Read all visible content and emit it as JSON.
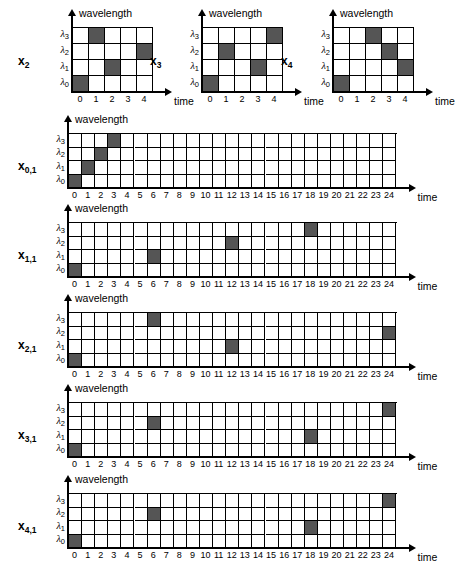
{
  "figure": {
    "axis_titles": {
      "y": "wavelength",
      "x": "time"
    },
    "wavelength_labels": [
      "λ",
      "λ",
      "λ",
      "λ"
    ],
    "wavelength_subscripts": [
      "3",
      "2",
      "1",
      "0"
    ],
    "fill_color": "#555555",
    "grid_color": "#000000",
    "background": "#ffffff"
  },
  "chart_data": {
    "type": "heatmap",
    "title": "",
    "xlabel": "time",
    "ylabel": "wavelength",
    "yticks": [
      "λ0",
      "λ1",
      "λ2",
      "λ3"
    ],
    "grid": true,
    "legend": "none",
    "panels": [
      {
        "name": "x2",
        "label_base": "x",
        "label_sub": "2",
        "columns": 5,
        "xticks": [
          "0",
          "1",
          "2",
          "3",
          "4"
        ],
        "xlim": [
          0,
          4
        ],
        "cells": [
          {
            "lambda": 3,
            "time": 1
          },
          {
            "lambda": 2,
            "time": 4
          },
          {
            "lambda": 1,
            "time": 2
          },
          {
            "lambda": 0,
            "time": 0
          }
        ]
      },
      {
        "name": "x3",
        "label_base": "x",
        "label_sub": "3",
        "columns": 5,
        "xticks": [
          "0",
          "1",
          "2",
          "3",
          "4"
        ],
        "xlim": [
          0,
          4
        ],
        "cells": [
          {
            "lambda": 3,
            "time": 4
          },
          {
            "lambda": 2,
            "time": 1
          },
          {
            "lambda": 1,
            "time": 3
          },
          {
            "lambda": 0,
            "time": 0
          }
        ]
      },
      {
        "name": "x4",
        "label_base": "x",
        "label_sub": "4",
        "columns": 5,
        "xticks": [
          "0",
          "1",
          "2",
          "3",
          "4"
        ],
        "xlim": [
          0,
          4
        ],
        "cells": [
          {
            "lambda": 3,
            "time": 2
          },
          {
            "lambda": 2,
            "time": 3
          },
          {
            "lambda": 1,
            "time": 4
          },
          {
            "lambda": 0,
            "time": 0
          }
        ]
      },
      {
        "name": "x0,1",
        "label_base": "x",
        "label_sub": "0,1",
        "columns": 25,
        "xticks": [
          "0",
          "1",
          "2",
          "3",
          "4",
          "5",
          "6",
          "7",
          "8",
          "9",
          "10",
          "11",
          "12",
          "13",
          "14",
          "15",
          "16",
          "17",
          "18",
          "19",
          "20",
          "21",
          "22",
          "23",
          "24"
        ],
        "xlim": [
          0,
          24
        ],
        "cells": [
          {
            "lambda": 0,
            "time": 0
          },
          {
            "lambda": 1,
            "time": 1
          },
          {
            "lambda": 2,
            "time": 2
          },
          {
            "lambda": 3,
            "time": 3
          }
        ]
      },
      {
        "name": "x1,1",
        "label_base": "x",
        "label_sub": "1,1",
        "columns": 25,
        "xticks": [
          "0",
          "1",
          "2",
          "3",
          "4",
          "5",
          "6",
          "7",
          "8",
          "9",
          "10",
          "11",
          "12",
          "13",
          "14",
          "15",
          "16",
          "17",
          "18",
          "19",
          "20",
          "21",
          "22",
          "23",
          "24"
        ],
        "xlim": [
          0,
          24
        ],
        "cells": [
          {
            "lambda": 0,
            "time": 0
          },
          {
            "lambda": 1,
            "time": 6
          },
          {
            "lambda": 2,
            "time": 12
          },
          {
            "lambda": 3,
            "time": 18
          }
        ]
      },
      {
        "name": "x2,1",
        "label_base": "x",
        "label_sub": "2,1",
        "columns": 25,
        "xticks": [
          "0",
          "1",
          "2",
          "3",
          "4",
          "5",
          "6",
          "7",
          "8",
          "9",
          "10",
          "11",
          "12",
          "13",
          "14",
          "15",
          "16",
          "17",
          "18",
          "19",
          "20",
          "21",
          "22",
          "23",
          "24"
        ],
        "xlim": [
          0,
          24
        ],
        "cells": [
          {
            "lambda": 0,
            "time": 0
          },
          {
            "lambda": 3,
            "time": 6
          },
          {
            "lambda": 1,
            "time": 12
          },
          {
            "lambda": 2,
            "time": 24
          }
        ]
      },
      {
        "name": "x3,1",
        "label_base": "x",
        "label_sub": "3,1",
        "columns": 25,
        "xticks": [
          "0",
          "1",
          "2",
          "3",
          "4",
          "5",
          "6",
          "7",
          "8",
          "9",
          "10",
          "11",
          "12",
          "13",
          "14",
          "15",
          "16",
          "17",
          "18",
          "19",
          "20",
          "21",
          "22",
          "23",
          "24"
        ],
        "xlim": [
          0,
          24
        ],
        "cells": [
          {
            "lambda": 0,
            "time": 0
          },
          {
            "lambda": 2,
            "time": 6
          },
          {
            "lambda": 1,
            "time": 18
          },
          {
            "lambda": 3,
            "time": 24
          }
        ]
      },
      {
        "name": "x4,1",
        "label_base": "x",
        "label_sub": "4,1",
        "columns": 25,
        "xticks": [
          "0",
          "1",
          "2",
          "3",
          "4",
          "5",
          "6",
          "7",
          "8",
          "9",
          "10",
          "11",
          "12",
          "13",
          "14",
          "15",
          "16",
          "17",
          "18",
          "19",
          "20",
          "21",
          "22",
          "23",
          "24"
        ],
        "xlim": [
          0,
          24
        ],
        "cells": [
          {
            "lambda": 0,
            "time": 0
          },
          {
            "lambda": 2,
            "time": 6
          },
          {
            "lambda": 1,
            "time": 18
          },
          {
            "lambda": 3,
            "time": 24
          }
        ]
      }
    ]
  }
}
